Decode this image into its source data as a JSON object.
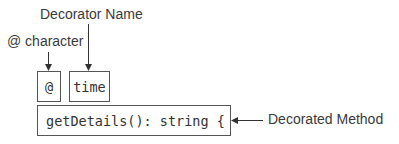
{
  "diagram": {
    "labels": {
      "decorator_name": "Decorator Name",
      "at_character": "@ character",
      "decorated_method": "Decorated Method"
    },
    "boxes": {
      "at_symbol": "@",
      "decorator": "time",
      "method": "getDetails(): string {"
    },
    "colors": {
      "stroke": "#555555",
      "text": "#333333"
    }
  }
}
